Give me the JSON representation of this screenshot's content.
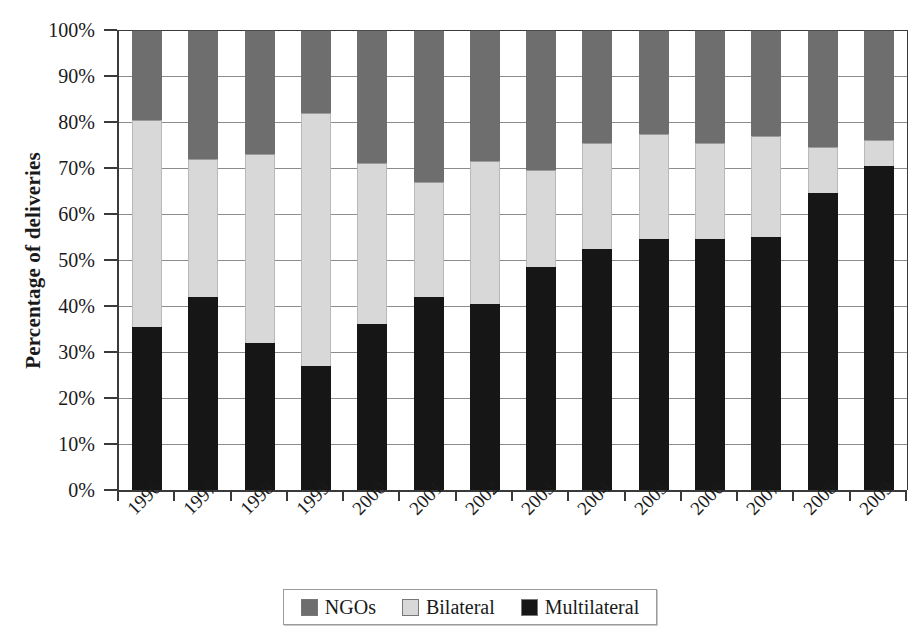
{
  "chart_data": {
    "type": "bar",
    "stacked": true,
    "stack_mode": "percent",
    "title": "",
    "xlabel": "",
    "ylabel": "Percentage of deliveries",
    "ylim": [
      0,
      100
    ],
    "ytick_labels": [
      "0%",
      "10%",
      "20%",
      "30%",
      "40%",
      "50%",
      "60%",
      "70%",
      "80%",
      "90%",
      "100%"
    ],
    "ytick_values": [
      0,
      10,
      20,
      30,
      40,
      50,
      60,
      70,
      80,
      90,
      100
    ],
    "grid": true,
    "legend_position": "bottom",
    "categories": [
      "1996",
      "1997",
      "1998",
      "1999",
      "2000",
      "2001",
      "2002",
      "2003",
      "2004",
      "2005",
      "2006",
      "2007",
      "2008",
      "2009"
    ],
    "series": [
      {
        "name": "Multilateral",
        "color": "#161616",
        "values": [
          35.5,
          42.0,
          32.0,
          27.0,
          36.0,
          42.0,
          40.5,
          48.5,
          52.5,
          54.5,
          54.5,
          55.0,
          64.5,
          70.5
        ]
      },
      {
        "name": "Bilateral",
        "color": "#d8d8d8",
        "values": [
          45.0,
          30.0,
          41.0,
          55.0,
          35.0,
          25.0,
          31.0,
          21.0,
          23.0,
          23.0,
          21.0,
          22.0,
          10.0,
          5.5
        ]
      },
      {
        "name": "NGOs",
        "color": "#6e6e6e",
        "values": [
          19.5,
          28.0,
          27.0,
          18.0,
          29.0,
          33.0,
          28.5,
          30.5,
          24.5,
          22.5,
          24.5,
          23.0,
          25.5,
          24.0
        ]
      }
    ],
    "cumulative_tops": {
      "multilateral": [
        35.5,
        42.0,
        32.0,
        27.0,
        36.0,
        42.0,
        40.5,
        48.5,
        52.5,
        54.5,
        54.5,
        55.0,
        64.5,
        70.5
      ],
      "bilateral": [
        80.5,
        72.0,
        73.0,
        82.0,
        71.0,
        67.0,
        71.5,
        69.5,
        75.5,
        77.5,
        75.5,
        77.0,
        74.5,
        76.0
      ],
      "ngos": [
        100,
        100,
        100,
        100,
        100,
        100,
        100,
        100,
        100,
        100,
        100,
        100,
        100,
        100
      ]
    }
  },
  "legend": {
    "items": [
      {
        "label": "NGOs",
        "swatch": "ngos"
      },
      {
        "label": "Bilateral",
        "swatch": "bilateral"
      },
      {
        "label": "Multilateral",
        "swatch": "multilateral"
      }
    ]
  },
  "colors": {
    "ngos": "#6e6e6e",
    "bilateral": "#d8d8d8",
    "multilateral": "#161616",
    "axis": "#3a3a3a",
    "grid": "#8c8c8c",
    "background": "#ffffff"
  }
}
